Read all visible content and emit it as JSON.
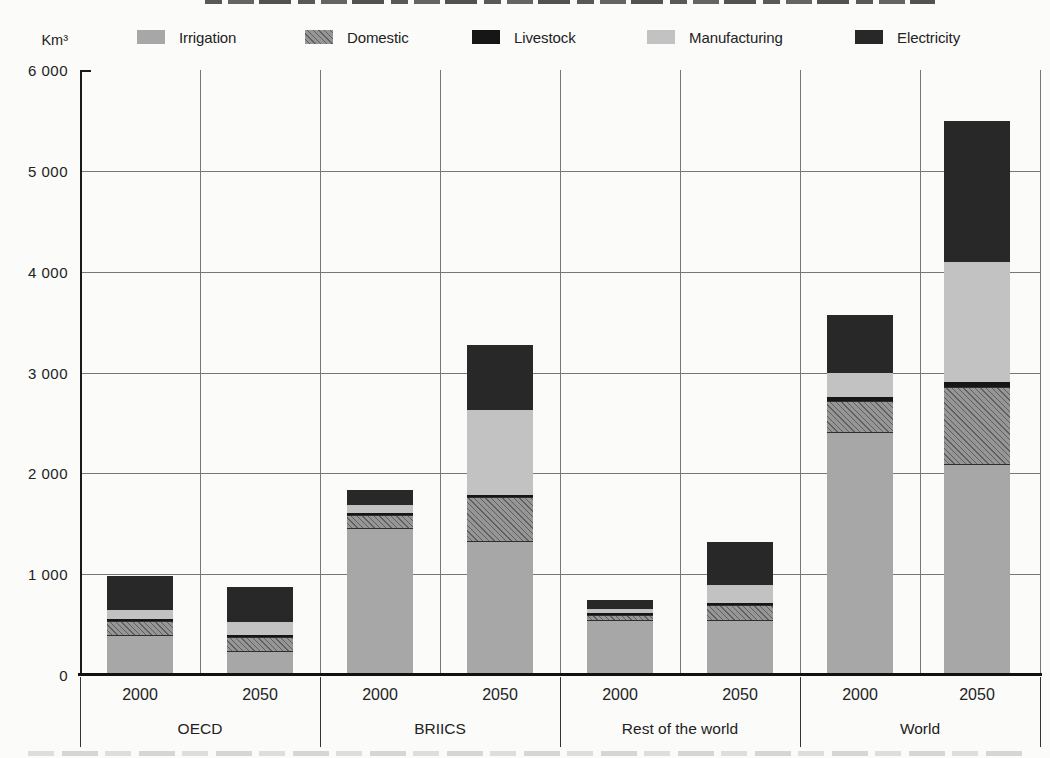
{
  "unit_label": "Km³",
  "legend": {
    "items": [
      {
        "label": "Irrigation"
      },
      {
        "label": "Domestic"
      },
      {
        "label": "Livestock"
      },
      {
        "label": "Manufacturing"
      },
      {
        "label": "Electricity"
      }
    ]
  },
  "y_axis": {
    "tick_labels": [
      "6 000",
      "5 000",
      "4 000",
      "3 000",
      "2 000",
      "1 000",
      "0"
    ],
    "min": 0,
    "max": 6000,
    "step": 1000
  },
  "x_axis": {
    "groups": [
      {
        "label": "OECD",
        "years": [
          "2000",
          "2050"
        ]
      },
      {
        "label": "BRIICS",
        "years": [
          "2000",
          "2050"
        ]
      },
      {
        "label": "Rest of the world",
        "years": [
          "2000",
          "2050"
        ]
      },
      {
        "label": "World",
        "years": [
          "2000",
          "2050"
        ]
      }
    ]
  },
  "chart_data": {
    "type": "bar",
    "stacked": true,
    "unit": "Km³",
    "categories": [
      "OECD 2000",
      "OECD 2050",
      "BRIICS 2000",
      "BRIICS 2050",
      "Rest of the world 2000",
      "Rest of the world 2050",
      "World 2000",
      "World 2050"
    ],
    "series": [
      {
        "name": "Irrigation",
        "color": "#a7a7a7",
        "pattern": "solid",
        "values": [
          390,
          225,
          1450,
          1320,
          540,
          540,
          2400,
          2080
        ]
      },
      {
        "name": "Domestic",
        "color": "#969696",
        "pattern": "diagonal-hatch",
        "hatch_color": "#5f5f5f",
        "values": [
          150,
          150,
          135,
          450,
          60,
          155,
          320,
          770
        ]
      },
      {
        "name": "Livestock",
        "color": "#161616",
        "pattern": "solid",
        "values": [
          15,
          15,
          20,
          20,
          15,
          20,
          40,
          50
        ]
      },
      {
        "name": "Manufacturing",
        "color": "#c2c2c2",
        "pattern": "solid",
        "values": [
          90,
          125,
          75,
          840,
          35,
          175,
          240,
          1190
        ]
      },
      {
        "name": "Electricity",
        "color": "#282828",
        "pattern": "solid",
        "values": [
          335,
          345,
          150,
          640,
          90,
          430,
          580,
          1400
        ]
      }
    ],
    "totals": [
      980,
      860,
      1830,
      3270,
      740,
      1320,
      3580,
      5490
    ],
    "title": "",
    "xlabel": "",
    "ylabel": "Km³",
    "ylim": [
      0,
      6000
    ],
    "grid": true,
    "legend_position": "top"
  }
}
